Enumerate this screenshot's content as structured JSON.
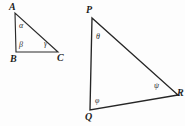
{
  "figure": {
    "background_color": "#fdfdfd",
    "stroke_color": "#2b2b2b",
    "label_color": "#1c1c1c",
    "triangles": [
      {
        "id": "triangle-abc",
        "name": "ABC",
        "vertices": [
          {
            "key": "A",
            "label": "A",
            "x": 15,
            "y": 13,
            "label_x": 9,
            "label_y": 2
          },
          {
            "key": "B",
            "label": "B",
            "x": 16,
            "y": 52,
            "label_x": 10,
            "label_y": 54
          },
          {
            "key": "C",
            "label": "C",
            "x": 58,
            "y": 52,
            "label_x": 57,
            "label_y": 53
          }
        ],
        "angles": [
          {
            "key": "alpha",
            "label": "α",
            "at_vertex": "A",
            "label_x": 19,
            "label_y": 22
          },
          {
            "key": "beta",
            "label": "β",
            "at_vertex": "B",
            "label_x": 19,
            "label_y": 41
          },
          {
            "key": "gamma",
            "label": "γ",
            "at_vertex": "C",
            "label_x": 44,
            "label_y": 40
          }
        ]
      },
      {
        "id": "triangle-pqr",
        "name": "PQR",
        "vertices": [
          {
            "key": "P",
            "label": "P",
            "x": 92,
            "y": 18,
            "label_x": 86,
            "label_y": 5
          },
          {
            "key": "Q",
            "label": "Q",
            "x": 90,
            "y": 110,
            "label_x": 85,
            "label_y": 112
          },
          {
            "key": "R",
            "label": "R",
            "x": 178,
            "y": 95,
            "label_x": 177,
            "label_y": 88
          }
        ],
        "angles": [
          {
            "key": "theta",
            "label": "θ",
            "at_vertex": "P",
            "label_x": 96,
            "label_y": 33
          },
          {
            "key": "phi",
            "label": "φ",
            "at_vertex": "Q",
            "label_x": 95,
            "label_y": 97
          },
          {
            "key": "psi",
            "label": "ψ",
            "at_vertex": "R",
            "label_x": 154,
            "label_y": 82
          }
        ]
      }
    ]
  }
}
